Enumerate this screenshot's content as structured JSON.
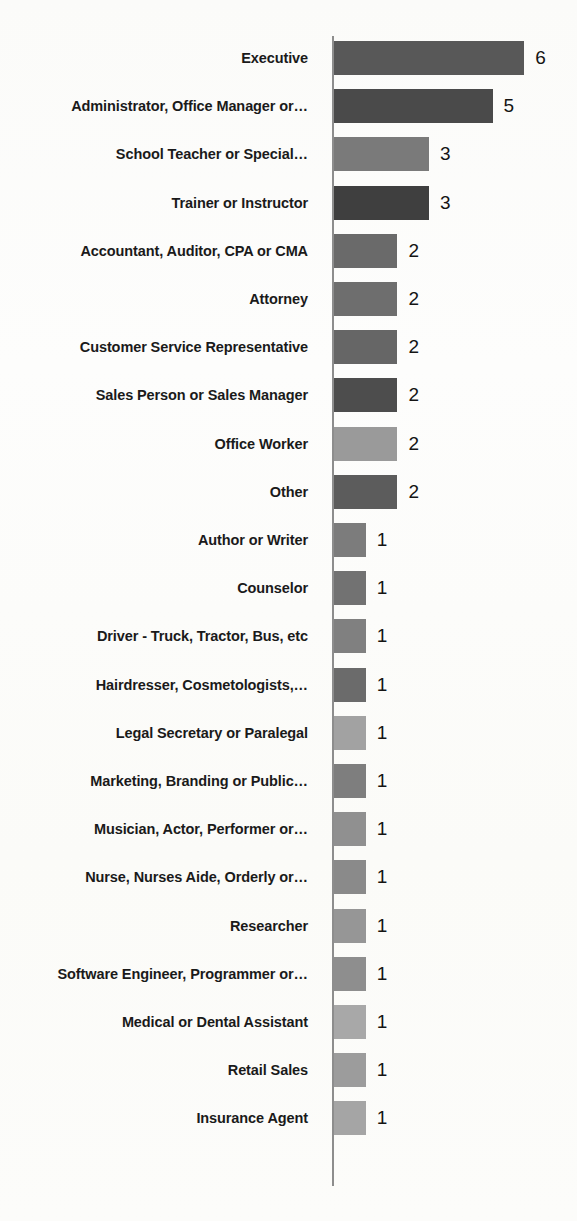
{
  "chart_data": {
    "type": "bar",
    "orientation": "horizontal",
    "title": "",
    "subtitle": "",
    "xlabel": "",
    "ylabel": "",
    "xlim": [
      0,
      6
    ],
    "grid": false,
    "legend": null,
    "value_labels_shown": true,
    "categories": [
      "Executive",
      "Administrator, Office Manager or…",
      "School Teacher or Special…",
      "Trainer or Instructor",
      "Accountant, Auditor, CPA or CMA",
      "Attorney",
      "Customer Service Representative",
      "Sales Person or Sales Manager",
      "Office Worker",
      "Other",
      "Author or Writer",
      "Counselor",
      "Driver - Truck, Tractor, Bus, etc",
      "Hairdresser, Cosmetologists,…",
      "Legal Secretary or Paralegal",
      "Marketing, Branding or Public…",
      "Musician, Actor, Performer or…",
      "Nurse, Nurses Aide, Orderly or…",
      "Researcher",
      "Software Engineer, Programmer or…",
      "Medical or Dental Assistant",
      "Retail Sales",
      "Insurance Agent"
    ],
    "values": [
      6,
      5,
      3,
      3,
      2,
      2,
      2,
      2,
      2,
      2,
      1,
      1,
      1,
      1,
      1,
      1,
      1,
      1,
      1,
      1,
      1,
      1,
      1
    ],
    "value_labels": [
      "6",
      "5",
      "3",
      "3",
      "2",
      "2",
      "2",
      "2",
      "2",
      "2",
      "1",
      "1",
      "1",
      "1",
      "1",
      "1",
      "1",
      "1",
      "1",
      "1",
      "1",
      "1",
      "1"
    ],
    "bar_colors": [
      "#585858",
      "#4a4a4a",
      "#7a7a7a",
      "#3f3f3f",
      "#6a6a6a",
      "#6e6e6e",
      "#666666",
      "#4d4d4d",
      "#9a9a9a",
      "#5c5c5c",
      "#7c7c7c",
      "#727272",
      "#808080",
      "#6b6b6b",
      "#a2a2a2",
      "#7e7e7e",
      "#909090",
      "#8a8a8a",
      "#969696",
      "#8e8e8e",
      "#a8a8a8",
      "#9c9c9c",
      "#a5a5a5"
    ],
    "axis_color": "#8d8d8d",
    "label_color": "#1a1a1a",
    "value_color": "#141414",
    "background_color": "#fcfcfa"
  }
}
